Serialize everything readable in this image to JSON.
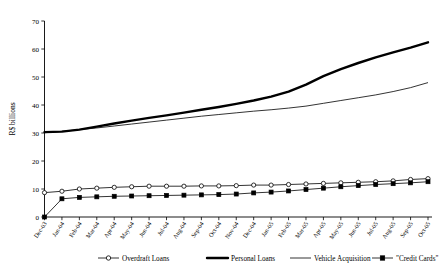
{
  "chart_data": {
    "type": "line",
    "title": "",
    "xlabel": "",
    "ylabel": "R$ billions",
    "ylim": [
      0,
      70
    ],
    "ytick_values": [
      0,
      10,
      20,
      30,
      40,
      50,
      60,
      70
    ],
    "ytick_labels": [
      "0",
      "10",
      "20",
      "30",
      "40",
      "50",
      "60",
      "70"
    ],
    "grid": false,
    "legend_position": "bottom",
    "categories": [
      "Dec-03",
      "Jan-04",
      "Feb-04",
      "Mar-04",
      "Apr-04",
      "May-04",
      "Jun-04",
      "Jul-04",
      "Aug-04",
      "Sep-04",
      "Oct-04",
      "Nov-04",
      "Dec-04",
      "Jan-05",
      "Feb-05",
      "Mar-05",
      "Apr-05",
      "May-05",
      "Jun-05",
      "Jul-05",
      "Aug-05",
      "Sep-05",
      "Oct-05"
    ],
    "series": [
      {
        "name": "Overdraft Loans",
        "marker": "open-circle",
        "line_weight": "thin",
        "values": [
          8.7,
          9.2,
          10.0,
          10.3,
          10.6,
          10.8,
          11.0,
          11.0,
          11.0,
          11.1,
          11.1,
          11.2,
          11.4,
          11.4,
          11.6,
          11.8,
          12.0,
          12.2,
          12.4,
          12.6,
          12.9,
          13.4,
          13.7
        ]
      },
      {
        "name": "Personal Loans",
        "marker": "none",
        "line_weight": "thick",
        "values": [
          30.3,
          30.5,
          31.2,
          32.3,
          33.4,
          34.4,
          35.4,
          36.3,
          37.3,
          38.3,
          39.3,
          40.4,
          41.6,
          43.0,
          44.8,
          47.3,
          50.3,
          52.8,
          55.0,
          57.0,
          58.8,
          60.5,
          62.4
        ]
      },
      {
        "name": "Vehicle Acquisition",
        "marker": "none",
        "line_weight": "thin",
        "values": [
          30.1,
          30.6,
          31.2,
          31.8,
          32.5,
          33.2,
          33.9,
          34.6,
          35.3,
          36.0,
          36.6,
          37.2,
          37.8,
          38.3,
          38.9,
          39.6,
          40.6,
          41.6,
          42.6,
          43.6,
          44.8,
          46.2,
          48.0
        ]
      },
      {
        "name": "\"Credit Cards\"",
        "marker": "solid-square",
        "line_weight": "thin",
        "values": [
          0.0,
          6.5,
          7.0,
          7.2,
          7.4,
          7.5,
          7.6,
          7.7,
          7.8,
          7.9,
          8.0,
          8.2,
          8.6,
          8.9,
          9.3,
          9.8,
          10.3,
          10.8,
          11.2,
          11.6,
          11.9,
          12.2,
          12.6
        ]
      }
    ],
    "legend": [
      {
        "label": "Overdraft Loans",
        "style": "open-circle-line"
      },
      {
        "label": "Personal Loans",
        "style": "thick-line"
      },
      {
        "label": "Vehicle Acquisition",
        "style": "thin-line"
      },
      {
        "label": "\"Credit Cards\"",
        "style": "solid-square-line"
      }
    ]
  }
}
